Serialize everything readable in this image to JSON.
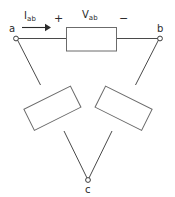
{
  "diagram": {
    "type": "delta-connected-three-phase-circuit",
    "background_color": "#ffffff",
    "line_color": "#4a4a4a",
    "text_color": "#2b2b2b",
    "nodes": [
      {
        "id": "a",
        "label": "a",
        "x": 16,
        "y": 38
      },
      {
        "id": "b",
        "label": "b",
        "x": 160,
        "y": 38
      },
      {
        "id": "c",
        "label": "c",
        "x": 88,
        "y": 180
      }
    ],
    "annotations": {
      "current_symbol": "I",
      "current_subscript": "ab",
      "voltage_symbol": "V",
      "voltage_subscript": "ab",
      "polarity_positive": "+",
      "polarity_negative": "−"
    },
    "elements": [
      {
        "name": "resistor-ab",
        "between": "a-b",
        "orientation": "horizontal"
      },
      {
        "name": "resistor-ac",
        "between": "a-c",
        "orientation": "diagonal-left"
      },
      {
        "name": "resistor-bc",
        "between": "b-c",
        "orientation": "diagonal-right"
      }
    ]
  }
}
